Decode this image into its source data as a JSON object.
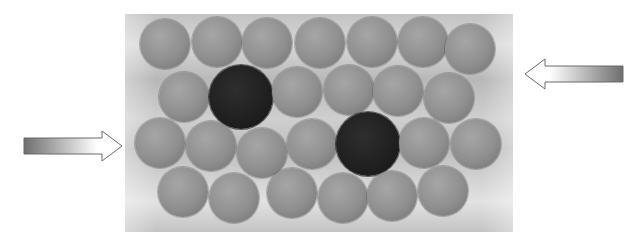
{
  "figure": {
    "container": {
      "x": 125,
      "y": 14,
      "width": 388,
      "height": 218
    },
    "colors": {
      "sphere": "#8f8f8f",
      "dark_sphere": "#1f1f1f",
      "arrow_dark": "#6e6e6e",
      "arrow_light": "#ffffff"
    },
    "spheres": [
      {
        "cx": 165,
        "cy": 44,
        "r": 25,
        "type": "normal"
      },
      {
        "cx": 217,
        "cy": 42,
        "r": 25,
        "type": "normal"
      },
      {
        "cx": 267,
        "cy": 43,
        "r": 25,
        "type": "normal"
      },
      {
        "cx": 320,
        "cy": 43,
        "r": 25,
        "type": "normal"
      },
      {
        "cx": 372,
        "cy": 42,
        "r": 25,
        "type": "normal"
      },
      {
        "cx": 423,
        "cy": 42,
        "r": 25,
        "type": "normal"
      },
      {
        "cx": 470,
        "cy": 49,
        "r": 25,
        "type": "normal"
      },
      {
        "cx": 184,
        "cy": 97,
        "r": 25,
        "type": "normal"
      },
      {
        "cx": 241,
        "cy": 97,
        "r": 32,
        "type": "dark"
      },
      {
        "cx": 297,
        "cy": 92,
        "r": 25,
        "type": "normal"
      },
      {
        "cx": 349,
        "cy": 90,
        "r": 25,
        "type": "normal"
      },
      {
        "cx": 398,
        "cy": 91,
        "r": 25,
        "type": "normal"
      },
      {
        "cx": 449,
        "cy": 98,
        "r": 25,
        "type": "normal"
      },
      {
        "cx": 160,
        "cy": 143,
        "r": 25,
        "type": "normal"
      },
      {
        "cx": 211,
        "cy": 146,
        "r": 25,
        "type": "normal"
      },
      {
        "cx": 262,
        "cy": 153,
        "r": 25,
        "type": "normal"
      },
      {
        "cx": 312,
        "cy": 144,
        "r": 25,
        "type": "normal"
      },
      {
        "cx": 368,
        "cy": 144,
        "r": 32,
        "type": "dark"
      },
      {
        "cx": 424,
        "cy": 143,
        "r": 25,
        "type": "normal"
      },
      {
        "cx": 476,
        "cy": 144,
        "r": 25,
        "type": "normal"
      },
      {
        "cx": 183,
        "cy": 192,
        "r": 25,
        "type": "normal"
      },
      {
        "cx": 234,
        "cy": 198,
        "r": 25,
        "type": "normal"
      },
      {
        "cx": 292,
        "cy": 193,
        "r": 25,
        "type": "normal"
      },
      {
        "cx": 343,
        "cy": 198,
        "r": 25,
        "type": "normal"
      },
      {
        "cx": 392,
        "cy": 196,
        "r": 25,
        "type": "normal"
      },
      {
        "cx": 443,
        "cy": 191,
        "r": 25,
        "type": "normal"
      }
    ],
    "arrows": [
      {
        "name": "right-pointing-arrow",
        "direction": "right",
        "x": 24,
        "y": 144
      },
      {
        "name": "left-pointing-arrow",
        "direction": "left",
        "x": 522,
        "y": 73
      }
    ]
  }
}
